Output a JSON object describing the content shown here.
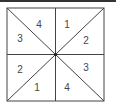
{
  "diagram": {
    "line_color": "#444444",
    "regions": [
      {
        "id": "top-left-upper",
        "label": "4",
        "x": 39,
        "y": 25
      },
      {
        "id": "top-right-upper",
        "label": "1",
        "x": 67,
        "y": 25
      },
      {
        "id": "top-left-lower",
        "label": "3",
        "x": 20,
        "y": 39
      },
      {
        "id": "top-right-lower",
        "label": "2",
        "x": 86,
        "y": 41
      },
      {
        "id": "bottom-left-upper",
        "label": "2",
        "x": 20,
        "y": 70
      },
      {
        "id": "bottom-right-upper",
        "label": "3",
        "x": 86,
        "y": 68
      },
      {
        "id": "bottom-left-lower",
        "label": "1",
        "x": 37,
        "y": 88
      },
      {
        "id": "bottom-right-lower",
        "label": "4",
        "x": 67,
        "y": 88
      }
    ]
  }
}
